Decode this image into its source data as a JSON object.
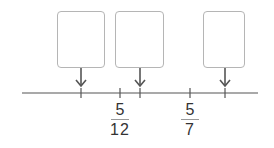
{
  "diagram": {
    "type": "number-line",
    "line": {
      "x1": 22,
      "x2": 258,
      "y": 93,
      "color": "#555555"
    },
    "ticks": [
      {
        "x": 81,
        "label": null
      },
      {
        "x": 120,
        "label": {
          "numerator": "5",
          "denominator": "12"
        }
      },
      {
        "x": 140,
        "label": null
      },
      {
        "x": 190,
        "label": {
          "numerator": "5",
          "denominator": "7"
        }
      },
      {
        "x": 225,
        "label": null
      }
    ],
    "answer_boxes": [
      {
        "x": 57,
        "width": 48,
        "points_to_tick_x": 81,
        "value": ""
      },
      {
        "x": 115,
        "width": 49,
        "points_to_tick_x": 140,
        "value": ""
      },
      {
        "x": 203,
        "width": 42,
        "points_to_tick_x": 225,
        "value": ""
      }
    ],
    "fractions": {
      "f1": {
        "numerator": "5",
        "denominator": "12"
      },
      "f2": {
        "numerator": "5",
        "denominator": "7"
      }
    }
  }
}
